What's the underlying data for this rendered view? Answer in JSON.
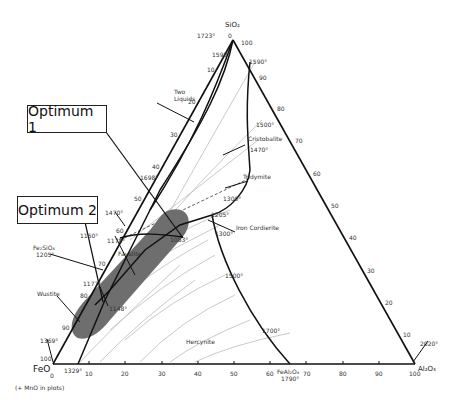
{
  "diagram": {
    "type": "ternary-phase-diagram",
    "vertices": {
      "top": {
        "label": "SiO₂",
        "temp": "1723°"
      },
      "left": {
        "label": "FeO",
        "temp": "1369°",
        "note": "(+ MnO in plots)"
      },
      "right": {
        "label": "Al₂O₃",
        "temp": "2020°"
      }
    },
    "callouts": [
      {
        "id": "optimum-1",
        "label": "Optimum 1"
      },
      {
        "id": "optimum-2",
        "label": "Optimum 2"
      }
    ],
    "bottom_axis_ticks": [
      "0",
      "10",
      "20",
      "30",
      "40",
      "50",
      "60",
      "70",
      "80",
      "90",
      "100"
    ],
    "right_axis_ticks": [
      "100",
      "90",
      "80",
      "70",
      "60",
      "50",
      "40",
      "30",
      "20",
      "10",
      "0"
    ],
    "left_axis_ticks": [
      "0",
      "10",
      "20",
      "30",
      "40",
      "50",
      "60",
      "70",
      "80",
      "90",
      "100"
    ],
    "phase_fields": [
      {
        "name": "Two Liquids"
      },
      {
        "name": "Cristobalite"
      },
      {
        "name": "Tridymite"
      },
      {
        "name": "Iron Cordierite"
      },
      {
        "name": "Fayalite"
      },
      {
        "name": "Wüstite",
        "display": "Wustite"
      },
      {
        "name": "Hercynite"
      }
    ],
    "compounds": [
      {
        "formula": "Fe₂SiO₄",
        "temp": "1205°"
      },
      {
        "formula": "FeAl₂O₄",
        "temp": "1790°"
      }
    ],
    "temperatures": [
      "1723°",
      "1698°",
      "1598°",
      "1590°",
      "1500°",
      "1470°",
      "1470°",
      "1300°",
      "1205°",
      "1300°",
      "1178°",
      "1150°",
      "1083°",
      "1177°",
      "1148°",
      "1500°",
      "1700°",
      "1329°",
      "1369°",
      "2020°",
      "1790°"
    ]
  },
  "labels": {
    "sio2": "SiO₂",
    "feo": "FeO",
    "al2o3": "Al₂O₃",
    "mno_note": "(+ MnO in plots)",
    "t1723": "1723°",
    "t1598": "1598°",
    "t1590": "1590°",
    "t1500a": "1500°",
    "t1470a": "1470°",
    "t1300a": "1300°",
    "t1205": "1205°",
    "t1300b": "1300°",
    "t1500b": "1500°",
    "t1700": "1700°",
    "t1698": "1698°",
    "t1470b": "1470°",
    "t1150": "1150°",
    "t1178": "1178°",
    "t1083": "1083°",
    "t1177": "1177°",
    "t1148": "1148°",
    "t1369": "1369°",
    "t1329": "1329°",
    "t2020": "2020°",
    "t1790": "1790°",
    "two": "Two",
    "liquids": "Liquids",
    "cristobalite": "Cristobalite",
    "tridymite": "Tridymite",
    "iron_cordierite": "Iron Cordierite",
    "fayalite": "Fayalite",
    "wustite": "Wustite",
    "hercynite": "Hercynite",
    "fe2sio4": "Fe₂SiO₄",
    "fe2sio4_t": "1205°",
    "feal2o4": "FeAl₂O₄",
    "optimum1": "Optimum 1",
    "optimum2": "Optimum 2",
    "zero_top": "0",
    "hundred_top": "100",
    "zero_left": "0",
    "hundred_left": "100",
    "zero_right": "0"
  }
}
